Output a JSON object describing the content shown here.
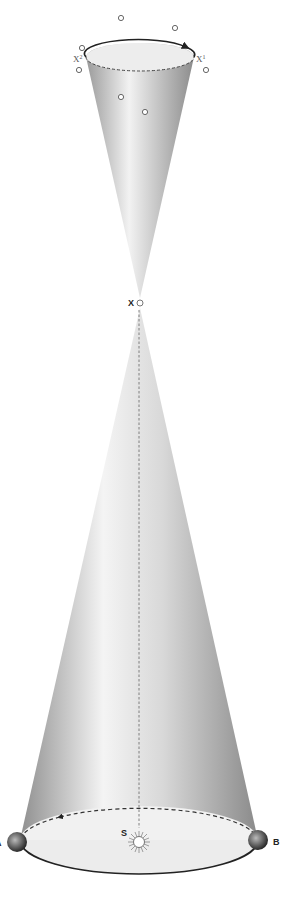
{
  "diagram": {
    "title": "",
    "labels": {
      "x_apex": "X",
      "x1": "X",
      "x1_sup": "1",
      "x2": "X",
      "x2_sup": "2",
      "sun": "S",
      "point_a": "A",
      "point_b": "B"
    },
    "elements": {
      "upper_cone": "small inverted cone with dashed ellipse rim and arrow",
      "lower_cone": "large cone with dashed back ellipse, solid front ellipse and arrow",
      "sun": "sun-icon at center of lower ellipse",
      "planets": [
        "A (left)",
        "B (right)"
      ],
      "stars": 8
    },
    "colors": {
      "cone_light": "#f2f2f2",
      "cone_dark": "#9a9a9a",
      "line": "#222222",
      "background": "#ffffff"
    }
  }
}
